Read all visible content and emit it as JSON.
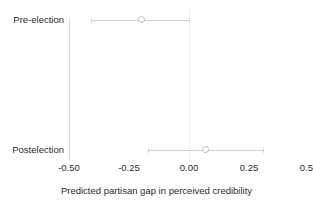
{
  "chart_data": {
    "type": "scatter",
    "title": "",
    "subtitle": "",
    "xlabel": "Predicted partisan gap in perceived credibility",
    "ylabel": "",
    "xlim": [
      -0.5,
      0.5
    ],
    "xticks": [
      -0.5,
      -0.25,
      0,
      0.25,
      0.5
    ],
    "xticklabels": [
      "-0.50",
      "-0.25",
      "0.00",
      "0.25",
      "0.50"
    ],
    "categories": [
      "Pre-election",
      "Postelection"
    ],
    "grid": false,
    "legend": "none",
    "reference_line": {
      "value": 0.0,
      "style": "dotted",
      "color": "#e2e2e2"
    },
    "marker": {
      "shape": "open-circle",
      "facecolor": "#ffffff",
      "edgecolor": "#b9b9b9"
    },
    "series": [
      {
        "name": "Predicted partisan gap",
        "points": [
          {
            "category": "Pre-election",
            "estimate": -0.2,
            "ci_low": -0.41,
            "ci_high": 0.0
          },
          {
            "category": "Postelection",
            "estimate": 0.07,
            "ci_low": -0.17,
            "ci_high": 0.31
          }
        ]
      }
    ]
  },
  "axis": {
    "x": {
      "title": "Predicted partisan gap in perceived credibility",
      "ticks": [
        {
          "value": -0.5,
          "label": "-0.50"
        },
        {
          "value": -0.25,
          "label": "-0.25"
        },
        {
          "value": 0.0,
          "label": "0.00"
        },
        {
          "value": 0.25,
          "label": "0.25"
        },
        {
          "value": 0.5,
          "label": "0.50"
        }
      ]
    },
    "y": {
      "categories": [
        {
          "label": "Pre-election"
        },
        {
          "label": "Postelection"
        }
      ]
    }
  },
  "colors": {
    "background": "#ffffff",
    "text": "#2b2b2b",
    "spine": "#d9d9d9",
    "whisker": "#cfcfcf",
    "marker_edge": "#b9b9b9",
    "zero_line": "#e2e2e2"
  }
}
